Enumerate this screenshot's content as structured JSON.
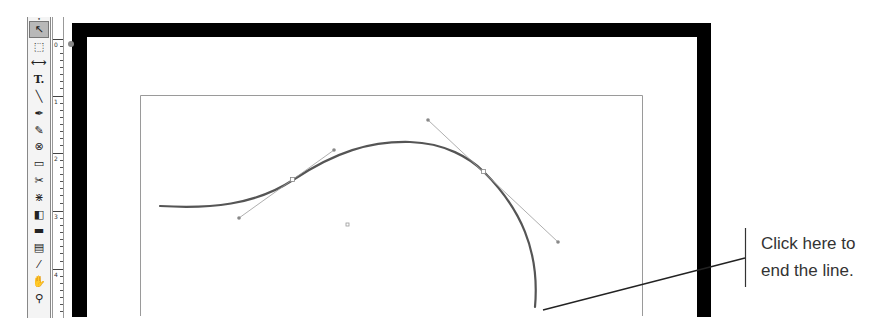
{
  "toolbox": {
    "tools": [
      {
        "name": "selection-tool",
        "glyph": "↖",
        "selected": true
      },
      {
        "name": "direct-selection-tool",
        "glyph": "⬚"
      },
      {
        "name": "position-tool",
        "glyph": "⟷"
      },
      {
        "name": "type-tool",
        "glyph": "T."
      },
      {
        "name": "line-tool",
        "glyph": "╲"
      },
      {
        "name": "pen-tool",
        "glyph": "✒"
      },
      {
        "name": "pencil-tool",
        "glyph": "✎"
      },
      {
        "name": "ellipse-frame-tool",
        "glyph": "⊗"
      },
      {
        "name": "rectangle-tool",
        "glyph": "▭"
      },
      {
        "name": "scissors-tool",
        "glyph": "✂"
      },
      {
        "name": "free-transform-tool",
        "glyph": "⋇"
      },
      {
        "name": "gradient-tool",
        "glyph": "◧"
      },
      {
        "name": "gradient-feather-tool",
        "glyph": "▬"
      },
      {
        "name": "note-tool",
        "glyph": "▤"
      },
      {
        "name": "eyedropper-tool",
        "glyph": "⁄"
      },
      {
        "name": "hand-tool",
        "glyph": "✋"
      },
      {
        "name": "zoom-tool",
        "glyph": "⚲"
      }
    ]
  },
  "ruler": {
    "labels": [
      "0",
      "1",
      "2",
      "3",
      "4"
    ]
  },
  "document": {
    "frame_color": "#000000",
    "margin_color": "#9a9a9a",
    "path_color": "#555555",
    "handle_color": "#999999"
  },
  "callout": {
    "line1": "Click here to",
    "line2": "end the line."
  }
}
